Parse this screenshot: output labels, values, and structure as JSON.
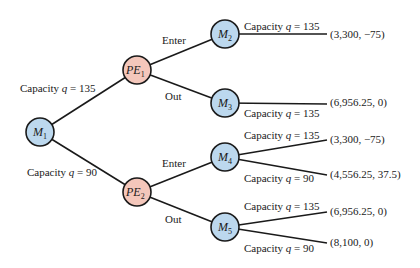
{
  "colors": {
    "incumbent_node_fill": "#bcd8ee",
    "entrant_node_fill": "#f4c7bb",
    "stroke": "#1a1a1a"
  },
  "nodes": {
    "m1": {
      "name": "M",
      "sub": "1"
    },
    "pe1": {
      "name": "PE",
      "sub": "1"
    },
    "pe2": {
      "name": "PE",
      "sub": "2"
    },
    "m2": {
      "name": "M",
      "sub": "2"
    },
    "m3": {
      "name": "M",
      "sub": "3"
    },
    "m4": {
      "name": "M",
      "sub": "4"
    },
    "m5": {
      "name": "M",
      "sub": "5"
    }
  },
  "edges": {
    "m1_pe1": {
      "prefix": "Capacity ",
      "var": "q",
      "suffix": " = 135"
    },
    "m1_pe2": {
      "prefix": "Capacity ",
      "var": "q",
      "suffix": " = 90"
    },
    "pe1_m2": {
      "label": "Enter"
    },
    "pe1_m3": {
      "label": "Out"
    },
    "pe2_m4": {
      "label": "Enter"
    },
    "pe2_m5": {
      "label": "Out"
    },
    "m2_t": {
      "prefix": "Capacity ",
      "var": "q",
      "suffix": " = 135"
    },
    "m3_t": {
      "prefix": "Capacity ",
      "var": "q",
      "suffix": " = 135"
    },
    "m4_t1": {
      "prefix": "Capacity ",
      "var": "q",
      "suffix": " = 135"
    },
    "m4_t2": {
      "prefix": "Capacity ",
      "var": "q",
      "suffix": " = 90"
    },
    "m5_t1": {
      "prefix": "Capacity ",
      "var": "q",
      "suffix": " = 135"
    },
    "m5_t2": {
      "prefix": "Capacity ",
      "var": "q",
      "suffix": " = 90"
    }
  },
  "payoffs": {
    "m2": "(3,300,  −75)",
    "m3": "(6,956.25, 0)",
    "m4_135": "(3,300,  −75)",
    "m4_90": "(4,556.25, 37.5)",
    "m5_135": "(6,956.25, 0)",
    "m5_90": "(8,100, 0)"
  }
}
